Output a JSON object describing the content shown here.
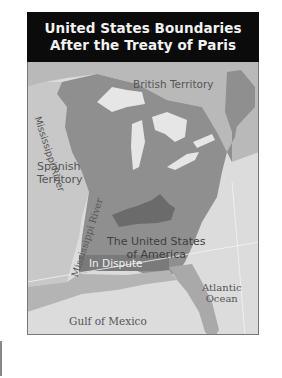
{
  "title": {
    "line1": "United States Boundaries",
    "line2": "After the Treaty of Paris"
  },
  "labels": {
    "british_territory": "British Territory",
    "mississippi_river_north": "Mississippi River",
    "spanish_territory_line1": "Spanish",
    "spanish_territory_line2": "Territory",
    "mississippi_river_south": "Mississippi River",
    "usa_line1": "The United States",
    "usa_line2": "of America",
    "in_dispute": "In Dispute",
    "atlantic_line1": "Atlantic",
    "atlantic_line2": "Ocean",
    "gulf": "Gulf of Mexico"
  },
  "colors": {
    "title_bg": "#0b0b0b",
    "title_text": "#f2f2f2",
    "british_territory": "#b9b9b9",
    "spanish_territory": "#c8c8c8",
    "united_states": "#8f8f8f",
    "kentucky_region": "#6b6b6b",
    "in_dispute": "#7a7a7a",
    "water": "#dcdcdc",
    "lakes": "#e6e6e6",
    "label_text": "#555555"
  }
}
